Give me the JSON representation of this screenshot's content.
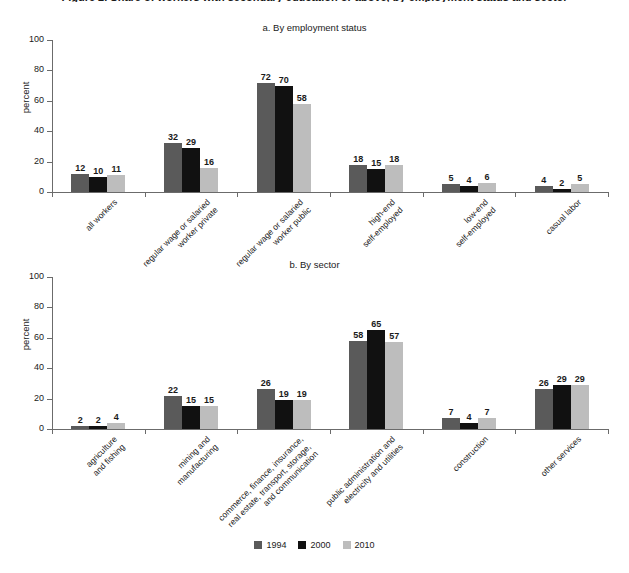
{
  "figure": {
    "title": "Figure 2. Share of workers with secondary education or above, by employment status and sector",
    "y_axis_label": "percent",
    "y_ticks": [
      0,
      20,
      40,
      60,
      80,
      100
    ],
    "y_max": 100
  },
  "legend": {
    "items": [
      {
        "label": "1994",
        "color": "#5a5a5a"
      },
      {
        "label": "2000",
        "color": "#111111"
      },
      {
        "label": "2010",
        "color": "#bdbdbd"
      }
    ]
  },
  "chart_data": [
    {
      "type": "bar",
      "title": "a. By employment status",
      "xlabel": "",
      "ylabel": "percent",
      "ylim": [
        0,
        100
      ],
      "grid": false,
      "legend_position": "bottom",
      "categories": [
        "all workers",
        "regular wage or salaried\nworker private",
        "regular wage or salaried\nworker public",
        "high-end\nself-employed",
        "low-end\nself-employed",
        "casual labor"
      ],
      "series": [
        {
          "name": "1994",
          "color": "#5a5a5a",
          "values": [
            12,
            32,
            72,
            18,
            5,
            4
          ]
        },
        {
          "name": "2000",
          "color": "#111111",
          "values": [
            10,
            29,
            70,
            15,
            4,
            2
          ]
        },
        {
          "name": "2010",
          "color": "#bdbdbd",
          "values": [
            11,
            16,
            58,
            18,
            6,
            5
          ]
        }
      ]
    },
    {
      "type": "bar",
      "title": "b. By sector",
      "xlabel": "",
      "ylabel": "percent",
      "ylim": [
        0,
        100
      ],
      "grid": false,
      "legend_position": "bottom",
      "categories": [
        "agriculture\nand fishing",
        "mining and\nmanufacturing",
        "commerce, finance, insurance,\nreal estate, transport, storage,\nand communication",
        "public administration and\nelectricity and utilities",
        "construction",
        "other services"
      ],
      "series": [
        {
          "name": "1994",
          "color": "#5a5a5a",
          "values": [
            2,
            22,
            26,
            58,
            7,
            26
          ]
        },
        {
          "name": "2000",
          "color": "#111111",
          "values": [
            2,
            15,
            19,
            65,
            4,
            29
          ]
        },
        {
          "name": "2010",
          "color": "#bdbdbd",
          "values": [
            4,
            15,
            19,
            57,
            7,
            29
          ]
        }
      ]
    }
  ]
}
